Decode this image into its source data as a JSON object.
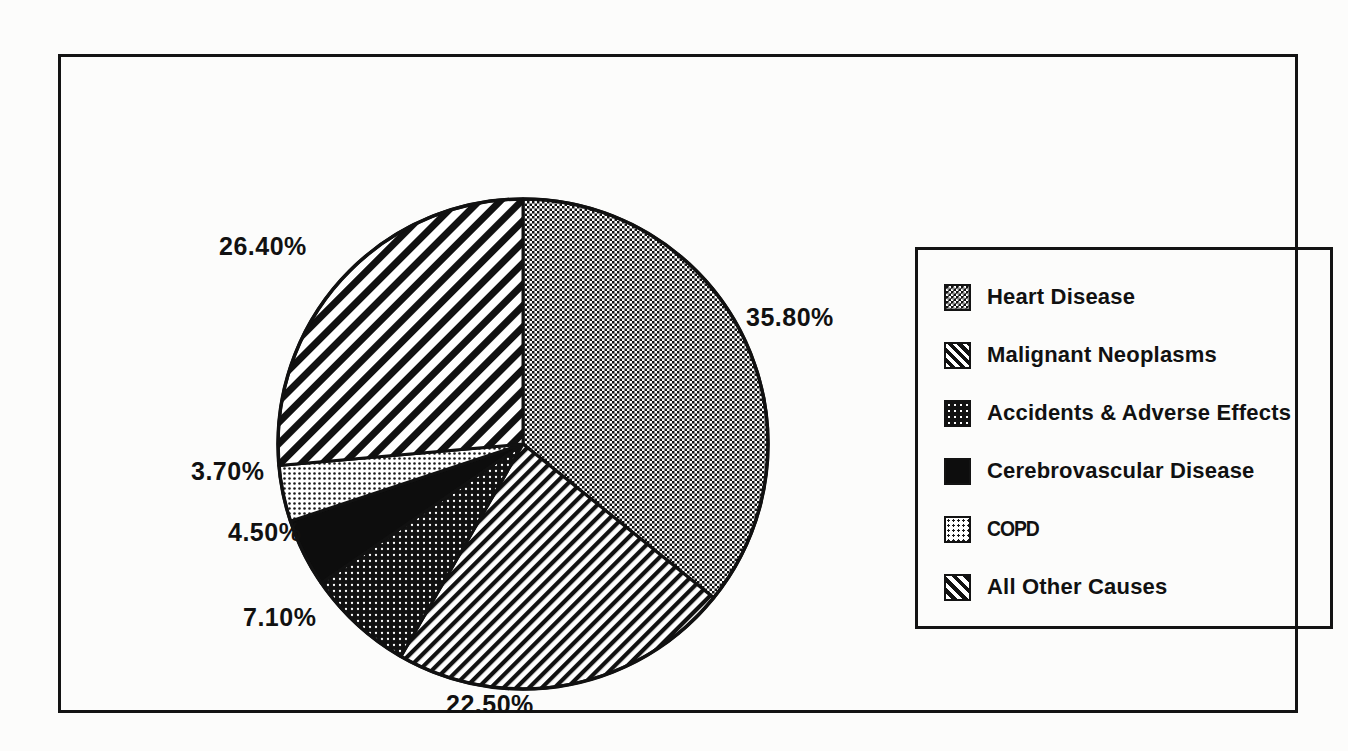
{
  "figure": {
    "background_color": "#fcfcfb",
    "frame_color": "#131313"
  },
  "legend": {
    "position": "right",
    "items": [
      {
        "label": "Heart Disease",
        "swatch": "fine-checker-dots"
      },
      {
        "label": "Malignant Neoplasms",
        "swatch": "diagonal-stripes-wide"
      },
      {
        "label": "Accidents & Adverse Effects",
        "swatch": "dark-dot-grid"
      },
      {
        "label": "Cerebrovascular Disease",
        "swatch": "solid-black"
      },
      {
        "label": "COPD",
        "swatch": "light-dot-grid"
      },
      {
        "label": "All Other Causes",
        "swatch": "diagonal-stripes-narrow"
      }
    ]
  },
  "labels": {
    "heart": "35.80%",
    "malignant": "22.50%",
    "accidents": "7.10%",
    "cerebrovascular": "4.50%",
    "copd": "3.70%",
    "other": "26.40%"
  },
  "chart_data": {
    "type": "pie",
    "title": "",
    "subtitle": "",
    "xlabel": "",
    "ylabel": "",
    "grid": false,
    "legend_position": "right",
    "start_angle_deg": 0,
    "direction": "clockwise",
    "categories": [
      "Heart Disease",
      "Malignant Neoplasms",
      "Accidents & Adverse Effects",
      "Cerebrovascular Disease",
      "COPD",
      "All Other Causes"
    ],
    "values": [
      35.8,
      22.5,
      7.1,
      4.5,
      3.7,
      26.4
    ],
    "data_labels": [
      "35.80%",
      "22.50%",
      "7.10%",
      "4.50%",
      "3.70%",
      "26.40%"
    ],
    "units": "percent",
    "slices": [
      {
        "name": "Heart Disease",
        "value": 35.8,
        "label": "35.80%",
        "fill": "fine-checker-dots",
        "start_deg": 0.0,
        "end_deg": 128.88
      },
      {
        "name": "Malignant Neoplasms",
        "value": 22.5,
        "label": "22.50%",
        "fill": "diagonal-stripes-wide",
        "start_deg": 128.88,
        "end_deg": 207.88
      },
      {
        "name": "Accidents & Adverse Effects",
        "value": 7.1,
        "label": "7.10%",
        "fill": "dark-dot-grid",
        "start_deg": 207.88,
        "end_deg": 233.44
      },
      {
        "name": "Cerebrovascular Disease",
        "value": 4.5,
        "label": "4.50%",
        "fill": "solid-black",
        "start_deg": 233.44,
        "end_deg": 249.64
      },
      {
        "name": "COPD",
        "value": 3.7,
        "label": "3.70%",
        "fill": "light-dot-grid",
        "start_deg": 249.64,
        "end_deg": 262.96
      },
      {
        "name": "All Other Causes",
        "value": 26.4,
        "label": "26.40%",
        "fill": "diagonal-stripes-narrow",
        "start_deg": 262.96,
        "end_deg": 360.0
      }
    ]
  }
}
